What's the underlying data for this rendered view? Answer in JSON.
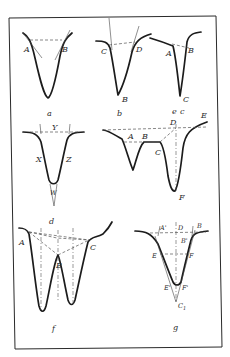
{
  "figure": {
    "panels": [
      {
        "id": "a",
        "caption": "a",
        "points": [
          "A",
          "B"
        ]
      },
      {
        "id": "b",
        "caption": "b",
        "points": [
          "C",
          "D",
          "B"
        ]
      },
      {
        "id": "c",
        "caption": "c",
        "points": [
          "A",
          "B",
          "C"
        ]
      },
      {
        "id": "d",
        "caption": "d",
        "points": [
          "Y",
          "X",
          "Z",
          "W"
        ]
      },
      {
        "id": "e",
        "caption": "e",
        "points": [
          "D",
          "E",
          "A",
          "B",
          "C",
          "F"
        ]
      },
      {
        "id": "f",
        "caption": "f",
        "points": [
          "A",
          "B",
          "C"
        ]
      },
      {
        "id": "g",
        "caption": "g",
        "points": [
          "A'",
          "D",
          "B",
          "B'",
          "E",
          "F",
          "E'",
          "F'",
          "C1"
        ]
      }
    ],
    "labels": {
      "a": {
        "A": "A",
        "B": "B",
        "caption": "a"
      },
      "b": {
        "C": "C",
        "D": "D",
        "B": "B",
        "caption": "b"
      },
      "c": {
        "A": "A",
        "B": "B",
        "C": "C",
        "caption": "c"
      },
      "d": {
        "Y": "Y",
        "X": "X",
        "Z": "Z",
        "W": "W",
        "caption": "d"
      },
      "e": {
        "D": "D",
        "E": "E",
        "A": "A",
        "B": "B",
        "C": "C",
        "F": "F",
        "caption": "e"
      },
      "f": {
        "A": "A",
        "B": "B",
        "C": "C",
        "caption": "f"
      },
      "g": {
        "A1": "A'",
        "D": "D",
        "B": "B",
        "B1": "B'",
        "E": "E",
        "F": "F",
        "E1": "E'",
        "F1": "F'",
        "C": "C",
        "C1": "1",
        "caption": "g"
      }
    }
  }
}
